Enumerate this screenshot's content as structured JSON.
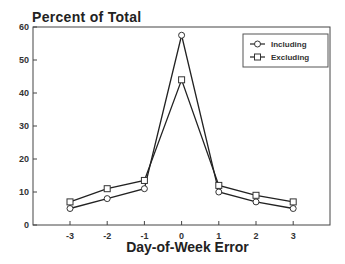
{
  "chart_data": {
    "type": "line",
    "title": "Percent of Total",
    "xlabel": "Day-of-Week Error",
    "ylabel": "Percent of Total",
    "x": [
      -3,
      -2,
      -1,
      0,
      1,
      2,
      3
    ],
    "x_tick_labels": [
      "-3",
      "-2",
      "-1",
      "0",
      "1",
      "2",
      "3"
    ],
    "y_tick_labels": [
      "0",
      "10",
      "20",
      "30",
      "40",
      "50",
      "60"
    ],
    "ylim": [
      0,
      60
    ],
    "grid": false,
    "legend_position": "upper right",
    "series": [
      {
        "name": "Including",
        "marker": "circle",
        "values": [
          5,
          8,
          11,
          57.5,
          10,
          7,
          5
        ]
      },
      {
        "name": "Excluding",
        "marker": "square",
        "values": [
          7,
          11,
          13.5,
          44,
          12,
          9,
          7
        ]
      }
    ]
  },
  "labels": {
    "title": "Percent of Total",
    "xlabel": "Day-of-Week Error",
    "legend": [
      "Including",
      "Excluding"
    ]
  }
}
